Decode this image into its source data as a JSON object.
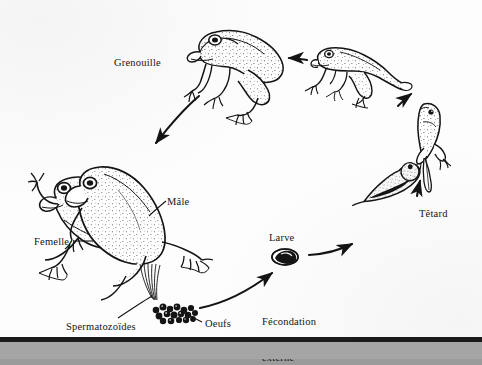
{
  "diagram": {
    "language": "fr",
    "background_color": "#9b9b9b",
    "page_color": "#fdfdfd",
    "ink_color": "#141414"
  },
  "labels": {
    "grenouille": "Grenouille",
    "tetard": "Têtard",
    "larve": "Larve",
    "male": "Mâle",
    "femelle": "Femelle",
    "spermatozoides": "Spermatozoïdes",
    "oeufs": "Oeufs",
    "fecondation_line1": "Fécondation",
    "fecondation_line2": "externe"
  },
  "stages": [
    {
      "name": "grenouille",
      "label": "Grenouille",
      "description": "adult frog, facing left"
    },
    {
      "name": "grenouillette",
      "label": "",
      "description": "young frog with tail, facing left"
    },
    {
      "name": "tetard-pattes",
      "label": "Têtard",
      "description": "tadpole with hind legs, vertical"
    },
    {
      "name": "tetard-jeune",
      "label": "Têtard",
      "description": "young tadpole, diagonal"
    },
    {
      "name": "larve",
      "label": "Larve",
      "description": "larva / embryo in jelly"
    },
    {
      "name": "oeufs",
      "label": "Oeufs",
      "description": "cluster of eggs"
    },
    {
      "name": "amplexus",
      "label": "Mâle / Femelle",
      "description": "mating pair, male on female"
    }
  ],
  "arrows": [
    {
      "name": "arrow-grenouille-to-amplexus",
      "from": "grenouille",
      "to": "amplexus"
    },
    {
      "name": "arrow-grenouillette-to-grenouille",
      "from": "grenouillette",
      "to": "grenouille"
    },
    {
      "name": "arrow-tetardpattes-to-grenouillette",
      "from": "tetard-pattes",
      "to": "grenouillette"
    },
    {
      "name": "arrow-tetardjeune-to-tetardpattes",
      "from": "tetard-jeune",
      "to": "tetard-pattes"
    },
    {
      "name": "arrow-larve-to-tetardjeune",
      "from": "larve",
      "to": "tetard-jeune"
    },
    {
      "name": "arrow-oeufs-to-larve",
      "from": "oeufs",
      "to": "larve"
    }
  ],
  "leaders": [
    {
      "name": "leader-male",
      "label": "Mâle"
    },
    {
      "name": "leader-femelle",
      "label": "Femelle"
    },
    {
      "name": "leader-spermatozoides",
      "label": "Spermatozoïdes"
    },
    {
      "name": "leader-oeufs",
      "label": "Oeufs"
    }
  ]
}
